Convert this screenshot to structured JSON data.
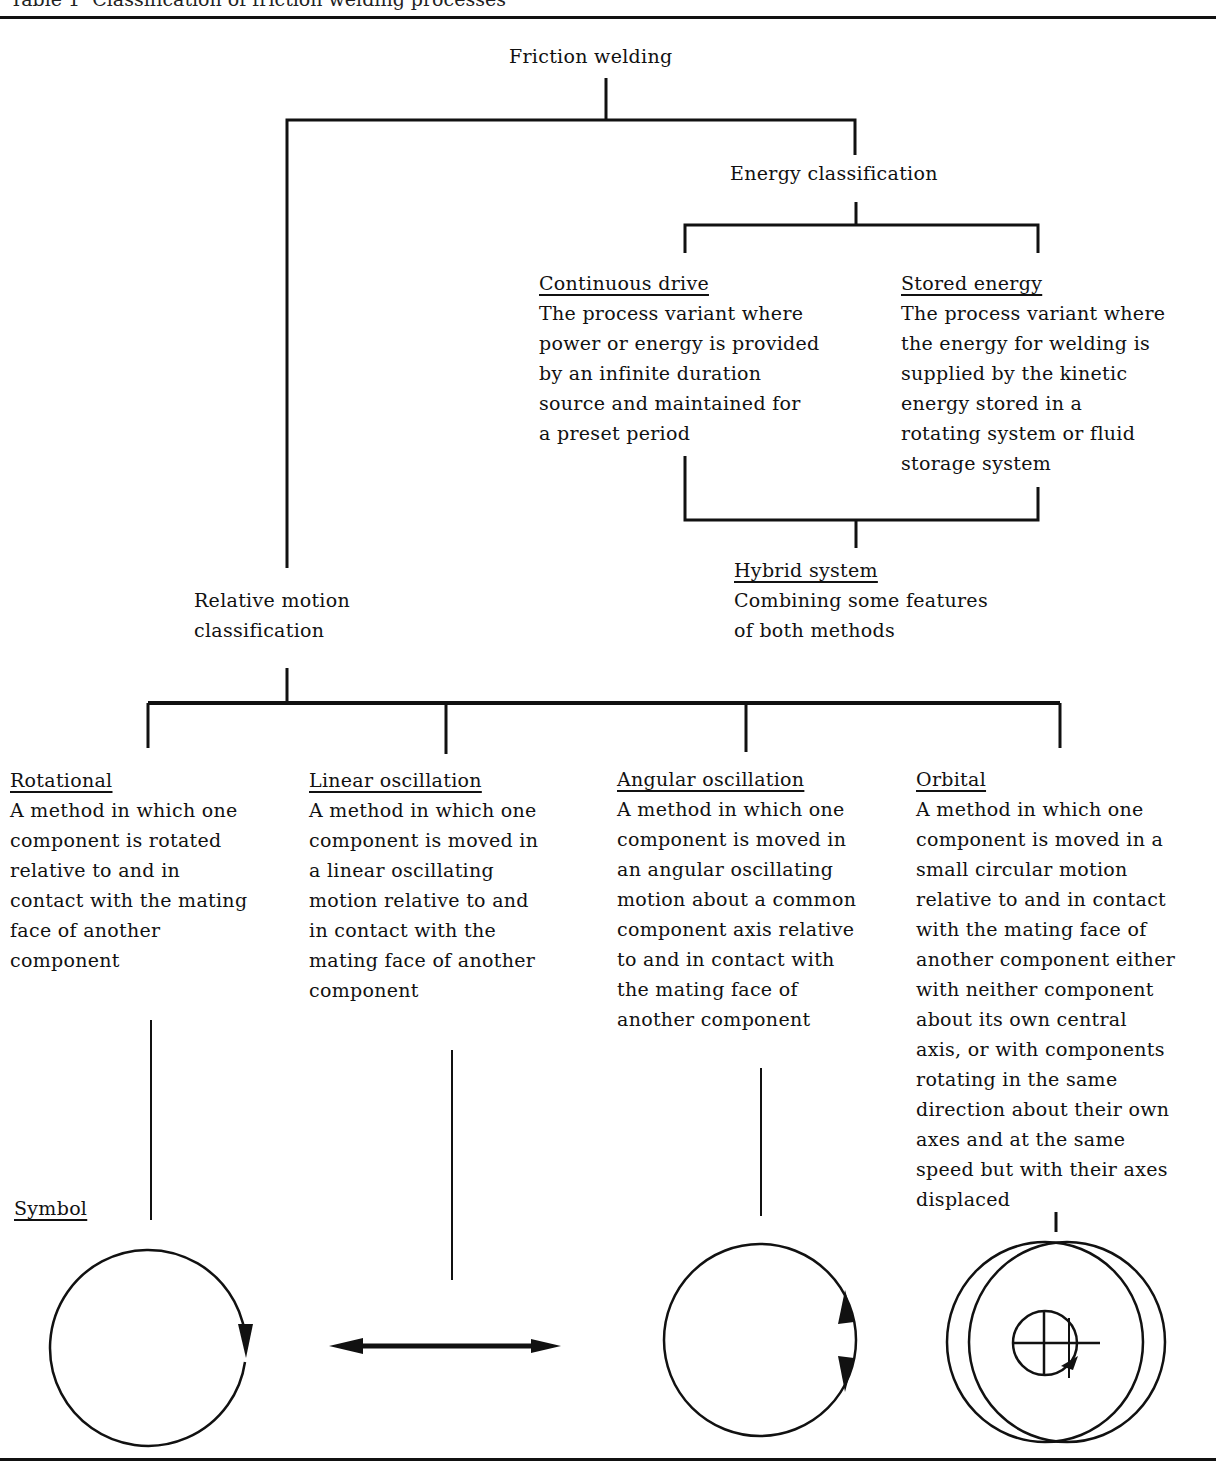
{
  "table_title": "Table 1  Classification of friction welding processes",
  "root": {
    "label": "Friction welding"
  },
  "energy": {
    "label": "Energy classification",
    "continuous_drive": {
      "heading": "Continuous drive",
      "lines": [
        "The process variant where",
        "power or energy is provided",
        "by an infinite duration",
        "source and maintained for",
        "a preset period"
      ]
    },
    "stored_energy": {
      "heading": "Stored energy",
      "lines": [
        "The process variant where",
        "the energy for welding is",
        "supplied by the kinetic",
        "energy stored in a",
        "rotating system or fluid",
        "storage system"
      ]
    },
    "hybrid": {
      "heading": "Hybrid system",
      "lines": [
        "Combining some features",
        "of both methods"
      ]
    }
  },
  "motion": {
    "label_lines": [
      "Relative motion",
      "classification"
    ],
    "rotational": {
      "heading": "Rotational",
      "lines": [
        "A method in which one",
        "component is rotated",
        "relative to and in",
        "contact with the mating",
        "face of another",
        "component"
      ]
    },
    "linear": {
      "heading": "Linear oscillation",
      "lines": [
        "A method in which one",
        "component is moved in",
        "a linear oscillating",
        "motion relative to and",
        "in contact with the",
        "mating face of another",
        "component"
      ]
    },
    "angular": {
      "heading": "Angular oscillation",
      "lines": [
        "A method in which one",
        "component is moved in",
        "an angular oscillating",
        "motion about a common",
        "component axis relative",
        "to and in contact with",
        "the mating face of",
        "another component"
      ]
    },
    "orbital": {
      "heading": "Orbital",
      "lines": [
        "A method in which one",
        "component is moved in a",
        "small circular motion",
        "relative to and in contact",
        "with the mating face of",
        "another component either",
        "with neither component",
        "about its own central",
        "axis, or with components",
        "rotating in the same",
        "direction about their own",
        "axes and at the same",
        "speed but with their axes",
        "displaced"
      ]
    }
  },
  "symbol_label": "Symbol",
  "symbols": [
    "rotation-arrow-icon",
    "double-headed-arrow-icon",
    "angular-oscillation-arrow-icon",
    "orbital-circles-icon"
  ]
}
